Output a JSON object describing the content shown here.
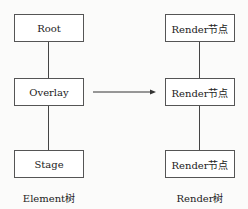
{
  "left_tree": {
    "nodes": [
      "Root",
      "Overlay",
      "Stage"
    ],
    "caption": "Element树"
  },
  "right_tree": {
    "nodes": [
      "Render节点",
      "Render节点",
      "Render节点"
    ],
    "caption": "Render树"
  },
  "arrow": {
    "from": "Overlay",
    "to": "Render节点"
  }
}
